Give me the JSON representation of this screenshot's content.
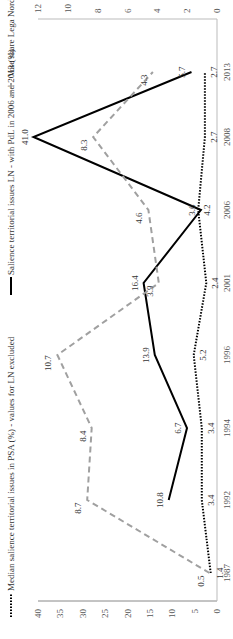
{
  "chart_data": {
    "type": "line",
    "title": "",
    "categories": [
      "1987",
      "1992",
      "1994",
      "1996",
      "2001",
      "2006",
      "2008",
      "2013"
    ],
    "series": [
      {
        "name": "Median salience territorial issues in PSA (%) - values for LN excluded",
        "style": "dotted",
        "color": "#000000",
        "axis": "left",
        "values": [
          1.4,
          3.4,
          3.4,
          5.2,
          2.4,
          4.2,
          2.7,
          2.7
        ]
      },
      {
        "name": "Salience territorial issues LN - with PdL in 2006 and 2013 (%)",
        "style": "solid",
        "color": "#000000",
        "axis": "left",
        "values": [
          null,
          10.8,
          6.7,
          13.9,
          16.4,
          3.6,
          41.0,
          5.7
        ]
      },
      {
        "name": "Vote share Lega Nord (%)",
        "style": "dashed",
        "color": "#a0a0a0",
        "axis": "right",
        "values": [
          0.5,
          8.7,
          8.4,
          10.7,
          3.9,
          4.6,
          8.3,
          4.3
        ]
      }
    ],
    "left_axis": {
      "ylim": [
        0,
        40
      ],
      "ticks": [
        "0",
        "5",
        "10",
        "15",
        "20",
        "25",
        "30",
        "35",
        "40"
      ]
    },
    "right_axis": {
      "ylim": [
        0,
        12
      ],
      "ticks": [
        "0",
        "2",
        "4",
        "6",
        "8",
        "10",
        "12"
      ]
    },
    "xlabel": "",
    "ylabel": "",
    "legend_position": "top",
    "grid": false,
    "orientation": "rotated 90 degrees counter-clockwise"
  },
  "legend": {
    "median": "Median salience territorial issues in PSA (%) - values for LN excluded",
    "ln": "Salience territorial issues LN - with PdL in 2006 and 2013 (%)",
    "vote": "Vote share Lega Nord (%)"
  }
}
